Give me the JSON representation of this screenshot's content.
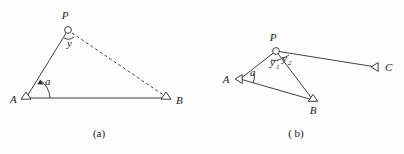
{
  "figure": {
    "background_color": "#fdfdfd",
    "ink_color": "#2b2b2b",
    "panels": [
      {
        "id": "panel-a",
        "caption": "(a)",
        "caption_x": 99,
        "caption_y": 137,
        "points": [
          {
            "name": "A",
            "label": "A",
            "x": 26,
            "y": 98,
            "marker": "triangle",
            "label_x": 10,
            "label_y": 103
          },
          {
            "name": "P",
            "label": "P",
            "x": 68,
            "y": 30,
            "marker": "circle",
            "label_x": 65,
            "label_y": 19
          },
          {
            "name": "B",
            "label": "B",
            "x": 166,
            "y": 98,
            "marker": "triangle",
            "label_x": 176,
            "label_y": 104
          }
        ],
        "edges": [
          {
            "from": "A",
            "to": "P",
            "style": "solid"
          },
          {
            "from": "A",
            "to": "B",
            "style": "solid"
          },
          {
            "from": "P",
            "to": "B",
            "style": "dashed"
          }
        ],
        "angles": [
          {
            "label": "a",
            "at": "A",
            "label_x": 45,
            "label_y": 85,
            "subscript": ""
          },
          {
            "label": "y",
            "at": "P",
            "label_x": 67,
            "label_y": 47,
            "subscript": ""
          }
        ]
      },
      {
        "id": "panel-b",
        "caption": "( b)",
        "caption_x": 296,
        "caption_y": 137,
        "points": [
          {
            "name": "A",
            "label": "A",
            "x": 240,
            "y": 79,
            "marker": "triangle",
            "label_x": 226,
            "label_y": 83
          },
          {
            "name": "P",
            "label": "P",
            "x": 276,
            "y": 51,
            "marker": "circle",
            "label_x": 273,
            "label_y": 41
          },
          {
            "name": "B",
            "label": "B",
            "x": 313,
            "y": 100,
            "marker": "triangle",
            "label_x": 310,
            "label_y": 114
          },
          {
            "name": "C",
            "label": "C",
            "x": 376,
            "y": 67,
            "marker": "triangle",
            "label_x": 385,
            "label_y": 71
          }
        ],
        "edges": [
          {
            "from": "A",
            "to": "P",
            "style": "solid"
          },
          {
            "from": "A",
            "to": "B",
            "style": "solid"
          },
          {
            "from": "P",
            "to": "B",
            "style": "solid"
          },
          {
            "from": "P",
            "to": "C",
            "style": "solid"
          }
        ],
        "angles": [
          {
            "label": "a",
            "at": "A",
            "label_x": 250,
            "label_y": 76,
            "subscript": ""
          },
          {
            "label": "y",
            "at": "P",
            "label_x": 272,
            "label_y": 66,
            "subscript": "1"
          },
          {
            "label": "y",
            "at": "P",
            "label_x": 284,
            "label_y": 62,
            "subscript": "2"
          }
        ]
      }
    ]
  }
}
